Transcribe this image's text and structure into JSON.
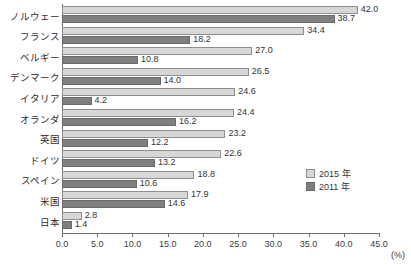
{
  "chart_data": {
    "type": "bar",
    "orientation": "horizontal",
    "title": "",
    "xlabel": "(%)",
    "ylabel": "",
    "xlim": [
      0.0,
      45.0
    ],
    "xticks": [
      "0.0",
      "5.0",
      "10.0",
      "15.0",
      "20.0",
      "25.0",
      "30.0",
      "35.0",
      "40.0",
      "45.0"
    ],
    "xtick_values": [
      0,
      5,
      10,
      15,
      20,
      25,
      30,
      35,
      40,
      45
    ],
    "grid": false,
    "legend_position": "center-right",
    "categories": [
      "ノルウェー",
      "フランス",
      "ベルギー",
      "デンマーク",
      "イタリア",
      "オランダ",
      "英国",
      "ドイツ",
      "スペイン",
      "米国",
      "日本"
    ],
    "series": [
      {
        "name": "2015 年",
        "color": "#d7d7d7",
        "values": [
          42.0,
          34.4,
          27.0,
          26.5,
          24.6,
          24.4,
          23.2,
          22.6,
          18.8,
          17.9,
          2.8
        ],
        "labels": [
          "42.0",
          "34.4",
          "27.0",
          "26.5",
          "24.6",
          "24.4",
          "23.2",
          "22.6",
          "18.8",
          "17.9",
          "2.8"
        ]
      },
      {
        "name": "2011 年",
        "color": "#7f7f7f",
        "values": [
          38.7,
          18.2,
          10.8,
          14.0,
          4.2,
          16.2,
          12.2,
          13.2,
          10.6,
          14.6,
          1.4
        ],
        "labels": [
          "38.7",
          "18.2",
          "10.8",
          "14.0",
          "4.2",
          "16.2",
          "12.2",
          "13.2",
          "10.6",
          "14.6",
          "1.4"
        ]
      }
    ]
  },
  "legend": {
    "items": [
      {
        "label": "2015 年"
      },
      {
        "label": "2011 年"
      }
    ]
  },
  "axis": {
    "unit_label": "(%)"
  }
}
